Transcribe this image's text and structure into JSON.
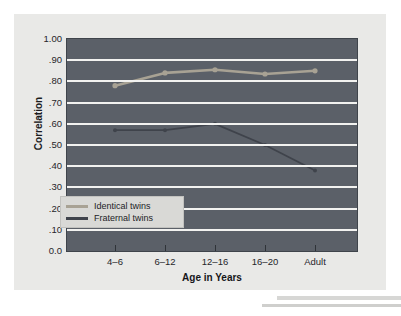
{
  "chart_data": {
    "type": "line",
    "title": "",
    "subtitle": "",
    "xlabel": "Age in Years",
    "ylabel": "Correlation",
    "categories": [
      "4–6",
      "6–12",
      "12–16",
      "16–20",
      "Adult"
    ],
    "ylim": [
      0.0,
      1.0
    ],
    "ytick_values": [
      1.0,
      0.9,
      0.8,
      0.7,
      0.6,
      0.5,
      0.4,
      0.3,
      0.2,
      0.1,
      0.0
    ],
    "ytick_labels": [
      "1.00",
      ".90",
      ".80",
      ".70",
      ".60",
      ".50",
      ".40",
      ".30",
      ".20",
      ".10",
      "0.0"
    ],
    "grid": true,
    "grid_color": "#f2f2f0",
    "plot_background": "#5b6068",
    "legend_position": "lower-left-inside",
    "series": [
      {
        "name": "Identical twins",
        "color": "#a8a294",
        "marker": "circle",
        "values": [
          0.78,
          0.84,
          0.855,
          0.835,
          0.85
        ]
      },
      {
        "name": "Fraternal twins",
        "color": "#3f434b",
        "marker": "circle",
        "values": [
          0.57,
          0.57,
          0.6,
          0.5,
          0.38
        ]
      }
    ]
  },
  "legend": {
    "items": [
      {
        "label": "Identical twins",
        "color": "#a8a294"
      },
      {
        "label": "Fraternal twins",
        "color": "#3f434b"
      }
    ]
  },
  "axes": {
    "y_title": "Correlation",
    "x_title": "Age in Years"
  }
}
